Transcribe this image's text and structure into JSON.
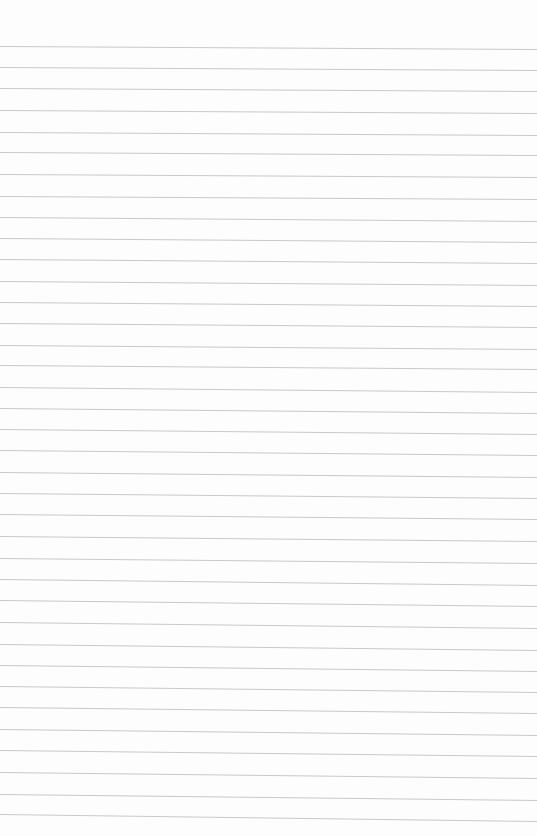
{
  "page": {
    "type": "lined-paper",
    "width": 537,
    "height": 836,
    "background_color": "#fdfdfd",
    "line_color": "#c9c9c9",
    "line_count": 37
  },
  "lines": [
    {
      "y_left": 46,
      "y_right": 49
    },
    {
      "y_left": 67,
      "y_right": 70
    },
    {
      "y_left": 88,
      "y_right": 91
    },
    {
      "y_left": 110,
      "y_right": 113
    },
    {
      "y_left": 132,
      "y_right": 135
    },
    {
      "y_left": 152,
      "y_right": 155
    },
    {
      "y_left": 174,
      "y_right": 177
    },
    {
      "y_left": 196,
      "y_right": 199
    },
    {
      "y_left": 217,
      "y_right": 221
    },
    {
      "y_left": 238,
      "y_right": 242
    },
    {
      "y_left": 259,
      "y_right": 263
    },
    {
      "y_left": 281,
      "y_right": 285
    },
    {
      "y_left": 302,
      "y_right": 306
    },
    {
      "y_left": 323,
      "y_right": 327
    },
    {
      "y_left": 345,
      "y_right": 349
    },
    {
      "y_left": 365,
      "y_right": 369
    },
    {
      "y_left": 387,
      "y_right": 392
    },
    {
      "y_left": 408,
      "y_right": 413
    },
    {
      "y_left": 429,
      "y_right": 434
    },
    {
      "y_left": 450,
      "y_right": 455
    },
    {
      "y_left": 472,
      "y_right": 477
    },
    {
      "y_left": 493,
      "y_right": 498
    },
    {
      "y_left": 514,
      "y_right": 519
    },
    {
      "y_left": 536,
      "y_right": 541
    },
    {
      "y_left": 558,
      "y_right": 563
    },
    {
      "y_left": 579,
      "y_right": 585
    },
    {
      "y_left": 600,
      "y_right": 606
    },
    {
      "y_left": 622,
      "y_right": 628
    },
    {
      "y_left": 644,
      "y_right": 650
    },
    {
      "y_left": 665,
      "y_right": 671
    },
    {
      "y_left": 686,
      "y_right": 692
    },
    {
      "y_left": 707,
      "y_right": 713
    },
    {
      "y_left": 729,
      "y_right": 735
    },
    {
      "y_left": 750,
      "y_right": 756
    },
    {
      "y_left": 772,
      "y_right": 778
    },
    {
      "y_left": 794,
      "y_right": 800
    },
    {
      "y_left": 814,
      "y_right": 821
    }
  ]
}
